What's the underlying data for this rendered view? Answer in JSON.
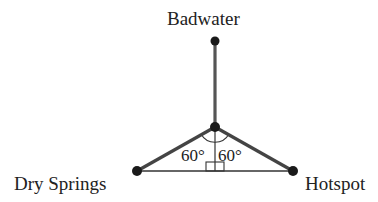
{
  "diagram": {
    "type": "geometry",
    "points": {
      "badwater": {
        "label": "Badwater",
        "x": 215,
        "y": 41
      },
      "center": {
        "label": "",
        "x": 215,
        "y": 127
      },
      "dry_springs": {
        "label": "Dry Springs",
        "x": 137,
        "y": 171
      },
      "hotspot": {
        "label": "Hotspot",
        "x": 293,
        "y": 171
      }
    },
    "angles": {
      "left": "60°",
      "right": "60°"
    },
    "right_angle_marker": true,
    "colors": {
      "line": "#444444",
      "dot": "#1a1a1a",
      "text": "#222222"
    }
  }
}
